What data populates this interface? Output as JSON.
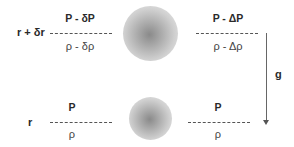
{
  "diagram": {
    "type": "fluid-parcel-buoyancy",
    "upper_level": {
      "radius_label": "r + δr",
      "parcel": {
        "pressure": "P - δP",
        "density": "ρ - δρ"
      },
      "environment": {
        "pressure": "P - ΔP",
        "density": "ρ - Δρ"
      }
    },
    "lower_level": {
      "radius_label": "r",
      "parcel": {
        "pressure": "P",
        "density": "ρ"
      },
      "environment": {
        "pressure": "P",
        "density": "ρ"
      }
    },
    "gravity": {
      "label": "g",
      "direction": "down"
    },
    "colors": {
      "text": "#2a2a2a",
      "dash": "#555555",
      "blob_core": "#8a8a8a",
      "blob_edge": "#f3f3f3"
    }
  }
}
